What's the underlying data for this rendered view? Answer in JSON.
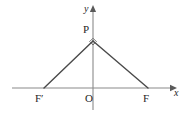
{
  "figure": {
    "background_color": "#ffffff",
    "axis_color": "#8a8a8a",
    "line_color": "#4a4a4a",
    "label_color": "#262626"
  },
  "axes": {
    "x_axis": {
      "label": "x",
      "label_style": "italic",
      "from": {
        "x": 12,
        "y": 88
      },
      "to": {
        "x": 172,
        "y": 88
      },
      "arrow": "right"
    },
    "y_axis": {
      "label": "y",
      "label_style": "italic",
      "from": {
        "x": 93,
        "y": 110
      },
      "to": {
        "x": 93,
        "y": 10
      },
      "arrow": "up"
    },
    "origin_label": "O"
  },
  "points": [
    {
      "name": "P",
      "label": "P",
      "x": 93,
      "y": 41
    },
    {
      "name": "F'",
      "label": "F′",
      "x": 44,
      "y": 88
    },
    {
      "name": "F",
      "label": "F",
      "x": 148,
      "y": 88
    },
    {
      "name": "O",
      "label": "O",
      "x": 93,
      "y": 88
    }
  ],
  "segments": [
    {
      "name": "PF-prime",
      "from": "F'",
      "to": "P"
    },
    {
      "name": "PF",
      "from": "P",
      "to": "F"
    }
  ],
  "markers": {
    "right_angle_at": "P",
    "right_angle_size": 5
  }
}
